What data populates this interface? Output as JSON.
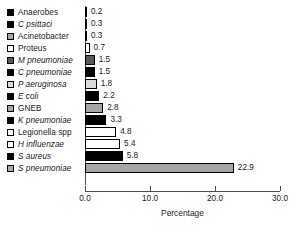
{
  "chart_data": {
    "type": "bar",
    "orientation": "horizontal",
    "title": "",
    "xlabel": "Percentage",
    "ylabel": "",
    "xlim": [
      0.0,
      30.0
    ],
    "xticks": [
      "0.0",
      "10.0",
      "20.0",
      "30.0"
    ],
    "xtick_values": [
      0.0,
      10.0,
      20.0,
      30.0
    ],
    "grid": false,
    "legend": "inline-left-swatches",
    "categories": [
      "Anaerobes",
      "C psittaci",
      "Acinetobacter",
      "Proteus",
      "M pneumoniae",
      "C pneumoniae",
      "P aeruginosa",
      "E coli",
      "GNEB",
      "K pneumoniae",
      "Legionella spp",
      "H influenzae",
      "S aureus",
      "S pneumoniae"
    ],
    "values": [
      0.2,
      0.3,
      0.3,
      0.7,
      1.5,
      1.5,
      1.8,
      2.2,
      2.8,
      3.3,
      4.8,
      5.4,
      5.8,
      22.9
    ],
    "value_labels": [
      "0.2",
      "0.3",
      "0.3",
      "0.7",
      "1.5",
      "1.5",
      "1.8",
      "2.2",
      "2.8",
      "3.3",
      "4.8",
      "5.4",
      "5.8",
      "22.9"
    ],
    "fills": [
      "black",
      "black",
      "gray",
      "white",
      "dark",
      "black",
      "light",
      "black",
      "gray",
      "black",
      "white",
      "white",
      "black",
      "gray"
    ],
    "italic": [
      false,
      true,
      false,
      false,
      true,
      true,
      true,
      true,
      false,
      true,
      false,
      true,
      true,
      true
    ],
    "colors": {
      "black": "#000000",
      "dark": "#595959",
      "gray": "#a6a6a6",
      "light": "#d9d9d9",
      "white": "#ffffff",
      "axis": "#4d4d4d",
      "text": "#1a1a1a",
      "background": "#ffffff"
    }
  }
}
